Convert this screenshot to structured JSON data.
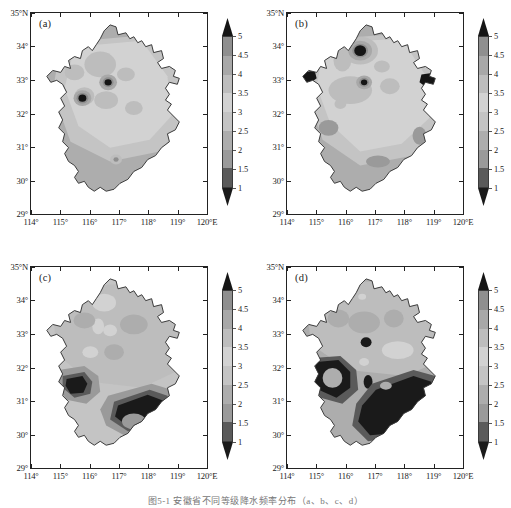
{
  "figure": {
    "caption": "图5-1 安徽省不同等级降水频率分布（a、b、c、d）"
  },
  "axis": {
    "x_ticks": [
      "114°",
      "115°",
      "116°",
      "117°",
      "118°",
      "119°",
      "120°E"
    ],
    "x_values": [
      114,
      115,
      116,
      117,
      118,
      119,
      120
    ],
    "y_ticks": [
      "35°N",
      "34°",
      "33°",
      "32°",
      "31°",
      "30°",
      "29°"
    ],
    "y_values": [
      35,
      34,
      33,
      32,
      31,
      30,
      29
    ],
    "xlim": [
      114,
      120
    ],
    "ylim": [
      29,
      35
    ]
  },
  "colorbar": {
    "ticks": [
      "5",
      "4.5",
      "4",
      "3.5",
      "3",
      "2.5",
      "2",
      "1.5",
      "1"
    ],
    "levels": [
      1,
      1.5,
      2,
      2.5,
      3,
      3.5,
      4,
      4.5,
      5
    ],
    "extend": "both",
    "orientation": "vertical",
    "colors": [
      "#151515",
      "#8f8f8f",
      "#a8a8a8",
      "#bdbdbd",
      "#d2d2d2",
      "#c4c4c4",
      "#adadad",
      "#9a9a9a",
      "#5a5a5a",
      "#1a1a1a"
    ]
  },
  "panels": [
    {
      "id": "a",
      "tag": "(a)",
      "label": "(a)"
    },
    {
      "id": "b",
      "tag": "(b)",
      "label": "(b)"
    },
    {
      "id": "c",
      "tag": "(c)",
      "label": "(c)"
    },
    {
      "id": "d",
      "tag": "(d)",
      "label": "(d)"
    }
  ],
  "chart_data": {
    "type": "heatmap",
    "title": "",
    "xlabel": "Longitude (°E)",
    "ylabel": "Latitude (°N)",
    "xlim": [
      114,
      120
    ],
    "ylim": [
      29,
      35
    ],
    "grid": false,
    "legend_position": "right",
    "colorbar_levels": [
      1,
      1.5,
      2,
      2.5,
      3,
      3.5,
      4,
      4.5,
      5
    ],
    "colorbar_ticklabels": [
      "1",
      "1.5",
      "2",
      "2.5",
      "3",
      "3.5",
      "4",
      "4.5",
      "5"
    ],
    "panels": [
      {
        "name": "(a)",
        "description": "Contour field over Anhui Province; broad mid-range 2.5-3.5 values across the north, lower 2-2.5 values in the south, with isolated maxima above 4.5 near 116.5°E/31.8°N and 117.1°E/32.4°N.",
        "value_range": [
          2.0,
          5.0
        ],
        "features": [
          {
            "lon": 116.5,
            "lat": 31.8,
            "value": 4.8,
            "kind": "local-maximum"
          },
          {
            "lon": 117.1,
            "lat": 32.4,
            "value": 4.7,
            "kind": "local-maximum"
          },
          {
            "lon": 116.6,
            "lat": 33.7,
            "value": 3.2,
            "kind": "local-minimum"
          },
          {
            "lon": 118.3,
            "lat": 31.5,
            "value": 3.4,
            "kind": "local-maximum"
          },
          {
            "lon": 117.6,
            "lat": 29.8,
            "value": 3.2,
            "kind": "local-maximum"
          }
        ]
      },
      {
        "name": "(b)",
        "description": "Similar spatial pattern with a pronounced maximum above 4.5 near 116.9°E/33.7°N, a small maximum near 117.1°E/32.4°N, and edge maxima at 115.0°E/33.0°N and 119.0°E/32.8°N.",
        "value_range": [
          2.0,
          5.0
        ],
        "features": [
          {
            "lon": 116.9,
            "lat": 33.7,
            "value": 4.9,
            "kind": "local-maximum"
          },
          {
            "lon": 117.1,
            "lat": 32.4,
            "value": 4.7,
            "kind": "local-maximum"
          },
          {
            "lon": 115.0,
            "lat": 33.0,
            "value": 4.6,
            "kind": "local-maximum"
          },
          {
            "lon": 119.0,
            "lat": 32.8,
            "value": 4.6,
            "kind": "local-maximum"
          },
          {
            "lon": 116.0,
            "lat": 31.2,
            "value": 2.4,
            "kind": "local-minimum"
          },
          {
            "lon": 117.8,
            "lat": 29.9,
            "value": 2.4,
            "kind": "local-minimum"
          }
        ]
      },
      {
        "name": "(c)",
        "description": "Mid-range values dominate the north; large dark regions below 1.5 appear in the southwest near 116.0°E/31.1°N and across the southeast near 118.5°E/30.2°N.",
        "value_range": [
          1.0,
          4.0
        ],
        "features": [
          {
            "lon": 116.0,
            "lat": 31.1,
            "value": 1.2,
            "kind": "local-minimum"
          },
          {
            "lon": 118.5,
            "lat": 30.2,
            "value": 1.1,
            "kind": "local-minimum"
          },
          {
            "lon": 116.9,
            "lat": 34.0,
            "value": 3.4,
            "kind": "local-maximum"
          },
          {
            "lon": 117.1,
            "lat": 32.5,
            "value": 3.4,
            "kind": "local-maximum"
          },
          {
            "lon": 116.3,
            "lat": 31.9,
            "value": 3.3,
            "kind": "local-maximum"
          }
        ]
      },
      {
        "name": "(d)",
        "description": "Largest dark low-value area of the four panels, covering most of the south and southeast below 1.5, with a band of 2-3 values through the centre and 3-4 values over the north.",
        "value_range": [
          1.0,
          4.0
        ],
        "features": [
          {
            "lon": 116.0,
            "lat": 31.2,
            "value": 1.2,
            "kind": "local-minimum"
          },
          {
            "lon": 118.3,
            "lat": 30.3,
            "value": 1.0,
            "kind": "local-minimum"
          },
          {
            "lon": 117.0,
            "lat": 31.8,
            "value": 1.3,
            "kind": "local-minimum"
          },
          {
            "lon": 117.1,
            "lat": 30.7,
            "value": 1.3,
            "kind": "local-minimum"
          },
          {
            "lon": 116.9,
            "lat": 34.0,
            "value": 3.6,
            "kind": "local-maximum"
          },
          {
            "lon": 118.2,
            "lat": 31.6,
            "value": 3.5,
            "kind": "local-maximum"
          }
        ]
      }
    ]
  }
}
